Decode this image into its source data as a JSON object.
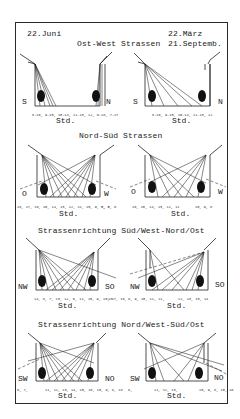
{
  "header": {
    "date_left": "22.Juni",
    "date_right_1": "22.März",
    "date_right_2": "21.Septemb."
  },
  "sections": [
    {
      "title": "Ost-West Strassen",
      "left": {
        "dir_left": "S",
        "dir_right": "N",
        "hours": "8-16, 9-15, 10-14, 11-13, 12, 6-18, 7-17",
        "unit": "Std."
      },
      "right": {
        "dir_left": "S",
        "dir_right": "N",
        "hours": "8-16, 9-15, 10-14, 11-13, 12",
        "unit": "Std."
      }
    },
    {
      "title": "Nord-Süd Strassen",
      "left": {
        "dir_left": "O",
        "dir_right": "W",
        "hours": "18, 17, 16, 15, 14, 13, 12, 11, 10, 9, 8, 7, 6",
        "hours_far": "7, 6",
        "unit": "Std."
      },
      "right": {
        "dir_left": "O",
        "dir_right": "W",
        "hours": "16, 15, 14, 13, 12, 11",
        "hours_far": "15, 9, 8",
        "unit": "Std."
      }
    },
    {
      "title": "Strassenrichtung Süd/West-Nord/Ost",
      "left": {
        "dir_left": "NW",
        "dir_right": "SO",
        "hours": "14, 8, 7, 13, 12, 6, 11, 10, 9, 15, 17, 16,",
        "hours_far": "18",
        "unit": "Std."
      },
      "right": {
        "dir_left": "NW",
        "dir_right": "SO",
        "hours": "8, 9, 10, 11, 11,",
        "hours_far": "12, 13, 15, 14",
        "unit": "Std."
      }
    },
    {
      "title": "Strassenrichtung Nord/West-Süd/Ost",
      "left": {
        "dir_left": "SW",
        "dir_right": "NO",
        "hours": "6, 7,",
        "hours_mid": "11, 12, 13, 14, 15, 16, 10, 9, 8, 18",
        "unit": "Std."
      },
      "right": {
        "dir_left": "SW",
        "dir_right": "NO",
        "hours": "8,",
        "hours_mid": "11, 12, 13,",
        "hours_far": "10, 9, 8, 15, 16",
        "unit": "Std."
      }
    }
  ],
  "colors": {
    "ink": "#1a1a1a",
    "paper": "#ffffff"
  }
}
